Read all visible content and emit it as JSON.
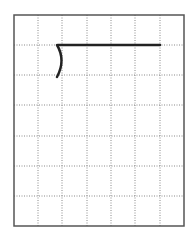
{
  "diagram": {
    "type": "grid-drawing",
    "grid": {
      "left": 14,
      "top": 15,
      "right": 184,
      "bottom": 226,
      "columns": 7,
      "rows": 7,
      "vertical_lines": [
        38,
        62,
        87,
        111,
        135,
        160
      ],
      "horizontal_lines": [
        45,
        75,
        105,
        136,
        166,
        196
      ],
      "border_color": "#555555",
      "grid_color": "#888888"
    },
    "shape": {
      "stroke_color": "#222222",
      "horizontal_segment": {
        "x1": 58,
        "y1": 45,
        "x2": 160,
        "y2": 45
      },
      "arc": {
        "start": [
          57,
          45
        ],
        "control": [
          66,
          60
        ],
        "end": [
          57,
          77
        ]
      }
    }
  }
}
